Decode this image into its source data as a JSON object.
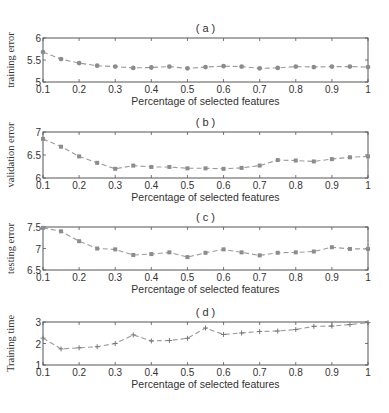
{
  "chart_data": [
    {
      "type": "line",
      "panel": "(a)",
      "title": "( a )",
      "xlabel": "Percentage of selected features",
      "ylabel": "training error",
      "xlim": [
        0.1,
        1
      ],
      "ylim": [
        5,
        6
      ],
      "xticks": [
        0.1,
        0.2,
        0.3,
        0.4,
        0.5,
        0.6,
        0.7,
        0.8,
        0.9,
        1
      ],
      "xtick_labels": [
        "0.1",
        "0.2",
        "0.3",
        "0.4",
        "0.5",
        "0.6",
        "0.7",
        "0.8",
        "0.9",
        "1"
      ],
      "yticks": [
        5,
        5.5,
        6
      ],
      "ytick_labels": [
        "5",
        "5.5",
        "6"
      ],
      "marker": "circle",
      "line_style": "dashed",
      "grid": false,
      "x": [
        0.1,
        0.15,
        0.2,
        0.25,
        0.3,
        0.35,
        0.4,
        0.45,
        0.5,
        0.55,
        0.6,
        0.65,
        0.7,
        0.75,
        0.8,
        0.85,
        0.9,
        0.95,
        1.0
      ],
      "values": [
        5.68,
        5.52,
        5.43,
        5.37,
        5.35,
        5.32,
        5.33,
        5.35,
        5.31,
        5.34,
        5.36,
        5.35,
        5.31,
        5.32,
        5.35,
        5.34,
        5.35,
        5.35,
        5.34
      ],
      "box": {
        "left": 43,
        "top": 38,
        "right": 368,
        "bottom": 82
      }
    },
    {
      "type": "line",
      "panel": "(b)",
      "title": "( b )",
      "xlabel": "Percentage of selected features",
      "ylabel": "validation error",
      "xlim": [
        0.1,
        1
      ],
      "ylim": [
        6,
        7
      ],
      "xticks": [
        0.1,
        0.2,
        0.3,
        0.4,
        0.5,
        0.6,
        0.7,
        0.8,
        0.9,
        1
      ],
      "xtick_labels": [
        "0.1",
        "0.2",
        "0.3",
        "0.4",
        "0.5",
        "0.6",
        "0.7",
        "0.8",
        "0.9",
        "1"
      ],
      "yticks": [
        6,
        6.5,
        7
      ],
      "ytick_labels": [
        "6",
        "6.5",
        "7"
      ],
      "marker": "square",
      "line_style": "dashed",
      "grid": false,
      "x": [
        0.1,
        0.15,
        0.2,
        0.25,
        0.3,
        0.35,
        0.4,
        0.45,
        0.5,
        0.55,
        0.6,
        0.65,
        0.7,
        0.75,
        0.8,
        0.85,
        0.9,
        0.95,
        1.0
      ],
      "values": [
        6.85,
        6.68,
        6.47,
        6.33,
        6.2,
        6.27,
        6.24,
        6.24,
        6.21,
        6.21,
        6.2,
        6.22,
        6.27,
        6.39,
        6.38,
        6.36,
        6.41,
        6.45,
        6.47
      ],
      "box": {
        "left": 43,
        "top": 132,
        "right": 368,
        "bottom": 178
      }
    },
    {
      "type": "line",
      "panel": "(c)",
      "title": "( c )",
      "xlabel": "Percentage of selected features",
      "ylabel": "testing error",
      "xlim": [
        0.1,
        1
      ],
      "ylim": [
        6.5,
        7.5
      ],
      "xticks": [
        0.1,
        0.2,
        0.3,
        0.4,
        0.5,
        0.6,
        0.7,
        0.8,
        0.9,
        1
      ],
      "xtick_labels": [
        "0.1",
        "0.2",
        "0.3",
        "0.4",
        "0.5",
        "0.6",
        "0.7",
        "0.8",
        "0.9",
        "1"
      ],
      "yticks": [
        6.5,
        7,
        7.5
      ],
      "ytick_labels": [
        "6.5",
        "7",
        "7.5"
      ],
      "marker": "square",
      "line_style": "dashed",
      "grid": false,
      "x": [
        0.1,
        0.15,
        0.2,
        0.25,
        0.3,
        0.35,
        0.4,
        0.45,
        0.5,
        0.55,
        0.6,
        0.65,
        0.7,
        0.75,
        0.8,
        0.85,
        0.9,
        0.95,
        1.0
      ],
      "values": [
        7.48,
        7.4,
        7.17,
        7.0,
        6.98,
        6.85,
        6.87,
        6.91,
        6.8,
        6.9,
        6.98,
        6.91,
        6.84,
        6.9,
        6.91,
        6.93,
        7.03,
        6.99,
        6.99
      ],
      "box": {
        "left": 43,
        "top": 227,
        "right": 368,
        "bottom": 270
      }
    },
    {
      "type": "line",
      "panel": "(d)",
      "title": "( d )",
      "xlabel": "Percentage of selected features",
      "ylabel": "Training time",
      "xlim": [
        0.1,
        1
      ],
      "ylim": [
        1,
        3
      ],
      "xticks": [
        0.1,
        0.2,
        0.3,
        0.4,
        0.5,
        0.6,
        0.7,
        0.8,
        0.9,
        1
      ],
      "xtick_labels": [
        "0.1",
        "0.2",
        "0.3",
        "0.4",
        "0.5",
        "0.6",
        "0.7",
        "0.8",
        "0.9",
        "1"
      ],
      "yticks": [
        1,
        2,
        3
      ],
      "ytick_labels": [
        "1",
        "2",
        "3"
      ],
      "marker": "plus",
      "line_style": "dashed",
      "grid": false,
      "x": [
        0.1,
        0.15,
        0.2,
        0.25,
        0.3,
        0.35,
        0.4,
        0.45,
        0.5,
        0.55,
        0.6,
        0.65,
        0.7,
        0.75,
        0.8,
        0.85,
        0.9,
        0.95,
        1.0
      ],
      "values": [
        2.25,
        1.75,
        1.8,
        1.85,
        2.0,
        2.4,
        2.12,
        2.14,
        2.24,
        2.72,
        2.42,
        2.49,
        2.56,
        2.58,
        2.65,
        2.8,
        2.81,
        2.88,
        2.97
      ],
      "box": {
        "left": 43,
        "top": 322,
        "right": 368,
        "bottom": 365
      }
    }
  ],
  "colors": {
    "axis": "#555555",
    "line": "#9a9a9a",
    "marker": "#8c8c8c",
    "text": "#333333"
  }
}
